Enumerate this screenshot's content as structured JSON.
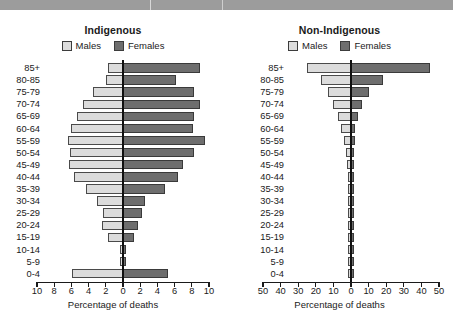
{
  "header": {
    "bar_color": "#9c9c9c"
  },
  "colors": {
    "males": "#dcdcdc",
    "females": "#6e6e6e",
    "axis": "#1a1a1a",
    "header": "#9c9c9c"
  },
  "legend": {
    "males_label": "Males",
    "females_label": "Females"
  },
  "panels": [
    {
      "id": "indigenous",
      "title": "Indigenous",
      "xlabel": "Percentage of deaths",
      "ticks": [
        "10",
        "8",
        "6",
        "4",
        "2",
        "0",
        "2",
        "4",
        "6",
        "8",
        "10"
      ]
    },
    {
      "id": "non-indigenous",
      "title": "Non-Indigenous",
      "xlabel": "Percentage of deaths",
      "ticks": [
        "50",
        "40",
        "30",
        "20",
        "10",
        "0",
        "10",
        "20",
        "30",
        "40",
        "50"
      ]
    }
  ],
  "age_groups": [
    "85+",
    "80-85",
    "75-79",
    "70-74",
    "65-69",
    "60-64",
    "55-59",
    "50-54",
    "45-49",
    "40-44",
    "35-39",
    "30-34",
    "25-29",
    "20-24",
    "15-19",
    "10-14",
    "5-9",
    "0-4"
  ],
  "chart_data": [
    {
      "type": "bar",
      "id": "indigenous",
      "title": "Indigenous",
      "subtitle": "",
      "xlabel": "Percentage of deaths",
      "ylabel": "",
      "orientation": "horizontal-pyramid",
      "categories": [
        "85+",
        "80-85",
        "75-79",
        "70-74",
        "65-69",
        "60-64",
        "55-59",
        "50-54",
        "45-49",
        "40-44",
        "35-39",
        "30-34",
        "25-29",
        "20-24",
        "15-19",
        "10-14",
        "5-9",
        "0-4"
      ],
      "series": [
        {
          "name": "Males",
          "color": "#dcdcdc",
          "side": "left",
          "values": [
            1.8,
            2.0,
            3.5,
            4.6,
            5.3,
            6.1,
            6.4,
            6.2,
            6.3,
            5.7,
            4.3,
            3.0,
            2.3,
            2.5,
            1.8,
            0.4,
            0.3,
            5.9
          ]
        },
        {
          "name": "Females",
          "color": "#6e6e6e",
          "side": "right",
          "values": [
            9.0,
            6.2,
            8.2,
            9.0,
            8.2,
            8.1,
            9.5,
            8.3,
            7.0,
            6.4,
            4.9,
            2.6,
            2.2,
            1.8,
            1.3,
            0.4,
            0.4,
            5.2
          ]
        }
      ],
      "xlim": [
        -10,
        10
      ],
      "xticks": [
        -10,
        -8,
        -6,
        -4,
        -2,
        0,
        2,
        4,
        6,
        8,
        10
      ],
      "xticklabels": [
        "10",
        "8",
        "6",
        "4",
        "2",
        "0",
        "2",
        "4",
        "6",
        "8",
        "10"
      ],
      "grid": false,
      "legend": "top"
    },
    {
      "type": "bar",
      "id": "non-indigenous",
      "title": "Non-Indigenous",
      "subtitle": "",
      "xlabel": "Percentage of deaths",
      "ylabel": "",
      "orientation": "horizontal-pyramid",
      "categories": [
        "85+",
        "80-85",
        "75-79",
        "70-74",
        "65-69",
        "60-64",
        "55-59",
        "50-54",
        "45-49",
        "40-44",
        "35-39",
        "30-34",
        "25-29",
        "20-24",
        "15-19",
        "10-14",
        "5-9",
        "0-4"
      ],
      "series": [
        {
          "name": "Males",
          "color": "#dcdcdc",
          "side": "left",
          "values": [
            25.0,
            17.0,
            13.0,
            10.0,
            7.5,
            5.5,
            4.0,
            3.0,
            2.2,
            1.6,
            1.1,
            0.8,
            0.6,
            0.5,
            0.4,
            0.3,
            0.3,
            1.0
          ]
        },
        {
          "name": "Females",
          "color": "#6e6e6e",
          "side": "right",
          "values": [
            45.0,
            18.0,
            10.0,
            6.0,
            4.0,
            2.5,
            2.0,
            1.5,
            1.2,
            1.0,
            0.8,
            0.7,
            0.5,
            0.4,
            0.3,
            0.3,
            0.3,
            1.0
          ]
        }
      ],
      "xlim": [
        -50,
        50
      ],
      "xticks": [
        -50,
        -40,
        -30,
        -20,
        -10,
        0,
        10,
        20,
        30,
        40,
        50
      ],
      "xticklabels": [
        "50",
        "40",
        "30",
        "20",
        "10",
        "0",
        "10",
        "20",
        "30",
        "40",
        "50"
      ],
      "grid": false,
      "legend": "top"
    }
  ]
}
